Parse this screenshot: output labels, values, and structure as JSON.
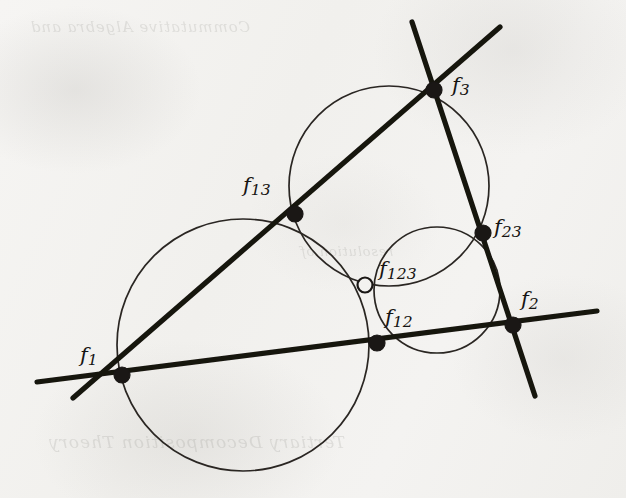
{
  "figure": {
    "background_color": "#f3f2f0",
    "ink_color": "#1a1715",
    "line_color": "#17140f",
    "circle_stroke_color": "#2a2623",
    "ghost_text_top": "Commutative Algebra and",
    "ghost_text_bottom": "Tertiary Decomposition Theory",
    "ghost_text_mid": "resolution of"
  },
  "chart_data": {
    "type": "diagram",
    "coordinate_space": {
      "width": 626,
      "height": 498,
      "origin": "top-left"
    },
    "circles": [
      {
        "name": "circle-1",
        "cx": 243,
        "cy": 345,
        "r": 126,
        "stroke_width": 1.7,
        "passes_through": [
          "f1",
          "f13",
          "f12",
          "f123"
        ]
      },
      {
        "name": "circle-3",
        "cx": 389,
        "cy": 186,
        "r": 100,
        "stroke_width": 1.7,
        "passes_through": [
          "f13",
          "f3",
          "f23",
          "f123"
        ]
      },
      {
        "name": "circle-2",
        "cx": 437,
        "cy": 290,
        "r": 63,
        "stroke_width": 1.7,
        "passes_through": [
          "f12",
          "f23",
          "f2",
          "f123"
        ]
      }
    ],
    "lines": [
      {
        "name": "line-12",
        "label": "line through f1, f12 and f2",
        "x1": 37,
        "y1": 382,
        "x2": 597,
        "y2": 311,
        "stroke_width": 5.2,
        "through": [
          "f1",
          "f12",
          "f2"
        ]
      },
      {
        "name": "line-13",
        "label": "line through f1, f13 and f3",
        "x1": 73,
        "y1": 398,
        "x2": 500,
        "y2": 27,
        "stroke_width": 5.2,
        "through": [
          "f1",
          "f13",
          "f3"
        ]
      },
      {
        "name": "line-23",
        "label": "line through f3, f23 and f2",
        "x1": 412,
        "y1": 22,
        "x2": 535,
        "y2": 396,
        "stroke_width": 5.2,
        "through": [
          "f3",
          "f23",
          "f2"
        ]
      }
    ],
    "points": [
      {
        "name": "f1",
        "x": 122,
        "y": 375,
        "filled": true,
        "radius": 8.0,
        "label": "f",
        "subscript": "1",
        "label_x": 80,
        "label_y": 343
      },
      {
        "name": "f2",
        "x": 513,
        "y": 325,
        "filled": true,
        "radius": 8.0,
        "label": "f",
        "subscript": "2",
        "label_x": 521,
        "label_y": 287
      },
      {
        "name": "f3",
        "x": 434,
        "y": 90,
        "filled": true,
        "radius": 8.0,
        "label": "f",
        "subscript": "3",
        "label_x": 452,
        "label_y": 73
      },
      {
        "name": "f12",
        "x": 377,
        "y": 343,
        "filled": true,
        "radius": 8.0,
        "label": "f",
        "subscript": "12",
        "label_x": 385,
        "label_y": 305
      },
      {
        "name": "f13",
        "x": 295,
        "y": 214,
        "filled": true,
        "radius": 8.0,
        "label": "f",
        "subscript": "13",
        "label_x": 243,
        "label_y": 173
      },
      {
        "name": "f23",
        "x": 483,
        "y": 233,
        "filled": true,
        "radius": 8.0,
        "label": "f",
        "subscript": "23",
        "label_x": 494,
        "label_y": 215
      },
      {
        "name": "f123",
        "x": 365,
        "y": 285,
        "filled": false,
        "radius": 7.5,
        "label": "f",
        "subscript": "123",
        "label_x": 379,
        "label_y": 257
      }
    ],
    "point_labels": [
      "f1",
      "f2",
      "f3",
      "f12",
      "f13",
      "f23",
      "f123"
    ],
    "legend": [],
    "xlabel": "",
    "ylabel": ""
  },
  "labels": {
    "f1": {
      "base": "f",
      "sub": "1"
    },
    "f2": {
      "base": "f",
      "sub": "2"
    },
    "f3": {
      "base": "f",
      "sub": "3"
    },
    "f12": {
      "base": "f",
      "sub": "12"
    },
    "f13": {
      "base": "f",
      "sub": "13"
    },
    "f23": {
      "base": "f",
      "sub": "23"
    },
    "f123": {
      "base": "f",
      "sub": "123"
    }
  }
}
